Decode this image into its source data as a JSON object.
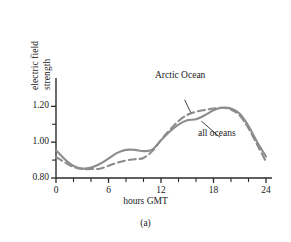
{
  "figure": {
    "panel_caption": "(a)",
    "axis_color": "#2b2b2b",
    "curve_color": "#8c8c8c"
  },
  "chart_data": {
    "type": "line",
    "title": "",
    "xlabel": "hours GMT",
    "ylabel": "electric field strength",
    "ylabel_line1": "electric field",
    "ylabel_line2": "strength",
    "xlim": [
      0,
      24
    ],
    "ylim": [
      0.8,
      1.28
    ],
    "xticks": [
      0,
      6,
      12,
      18,
      24
    ],
    "xtick_labels": [
      "0",
      "6",
      "12",
      "18",
      "24"
    ],
    "xticks_minor": [
      2,
      4,
      8,
      10,
      14,
      16,
      20,
      22
    ],
    "yticks": [
      0.8,
      1.0,
      1.2
    ],
    "ytick_labels": [
      "0.80",
      "1.00",
      "1.20"
    ],
    "yticks_minor": [
      0.9,
      1.1
    ],
    "grid": false,
    "legend_position": "inline-annotations",
    "annotations": [
      {
        "text": "Arctic Ocean",
        "series": "Arctic Ocean",
        "label_x": 13.1,
        "label_y": 1.265,
        "leader_to_x": 15.4,
        "leader_to_y": 1.165
      },
      {
        "text": "all oceans",
        "series": "all oceans",
        "label_x": 17.6,
        "label_y": 1.055,
        "leader_to_x": 16.6,
        "leader_to_y": 1.118
      }
    ],
    "series": [
      {
        "name": "all oceans",
        "style": "solid",
        "color": "#8c8c8c",
        "x": [
          0,
          1,
          2,
          3,
          4,
          5,
          6,
          7,
          8,
          9,
          10,
          11,
          12,
          13,
          14,
          15,
          16,
          17,
          18,
          19,
          20,
          21,
          22,
          23,
          24
        ],
        "y": [
          0.955,
          0.905,
          0.868,
          0.853,
          0.858,
          0.878,
          0.908,
          0.94,
          0.957,
          0.957,
          0.95,
          0.958,
          1.01,
          1.06,
          1.098,
          1.122,
          1.128,
          1.15,
          1.178,
          1.192,
          1.188,
          1.158,
          1.09,
          1.0,
          0.92
        ]
      },
      {
        "name": "Arctic Ocean",
        "style": "dashed",
        "color": "#8c8c8c",
        "x": [
          0,
          1,
          2,
          3,
          4,
          5,
          6,
          7,
          8,
          9,
          10,
          11,
          12,
          13,
          14,
          15,
          16,
          17,
          18,
          19,
          20,
          21,
          22,
          23,
          24
        ],
        "y": [
          0.918,
          0.888,
          0.862,
          0.85,
          0.85,
          0.852,
          0.868,
          0.885,
          0.898,
          0.905,
          0.912,
          0.95,
          1.012,
          1.068,
          1.118,
          1.152,
          1.17,
          1.18,
          1.188,
          1.192,
          1.182,
          1.148,
          1.078,
          0.985,
          0.892
        ]
      }
    ]
  }
}
